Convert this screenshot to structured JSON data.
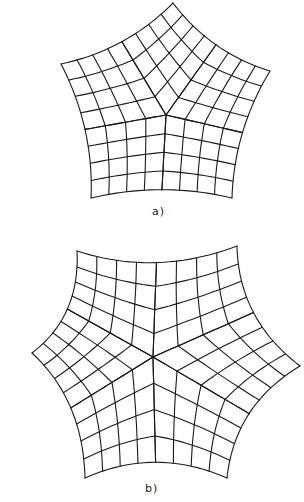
{
  "figure": {
    "panels": [
      {
        "id": "a",
        "label": "a)",
        "shape": "concave pentagon",
        "vertices": [
          [
            173,
            3
          ],
          [
            270,
            71
          ],
          [
            232,
            198
          ],
          [
            91,
            198
          ],
          [
            61,
            64
          ]
        ],
        "center": [
          166,
          115
        ],
        "grid_divisions": 4,
        "concavity": 0.1
      },
      {
        "id": "b",
        "label": "b)",
        "shape": "concave hexagon",
        "vertices": [
          [
            77,
            251
          ],
          [
            237,
            246
          ],
          [
            300,
            366
          ],
          [
            227,
            478
          ],
          [
            85,
            478
          ],
          [
            32,
            353
          ]
        ],
        "center": [
          153,
          357
        ],
        "grid_divisions": 4,
        "concavity": 0.13
      }
    ],
    "line_color": "#1a1a1a",
    "background": "#ffffff"
  }
}
